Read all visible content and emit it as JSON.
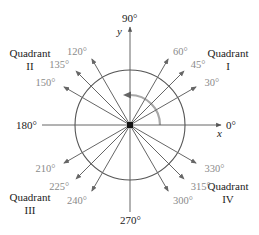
{
  "diagram": {
    "center": [
      130,
      125
    ],
    "circle_radius": 55,
    "axes": {
      "x_label": "x",
      "y_label": "y",
      "deg_0": "0°",
      "deg_90": "90°",
      "deg_180": "180°",
      "deg_270": "270°"
    },
    "quadrants": {
      "q1": {
        "line1": "Quadrant",
        "line2": "I"
      },
      "q2": {
        "line1": "Quadrant",
        "line2": "II"
      },
      "q3": {
        "line1": "Quadrant",
        "line2": "III"
      },
      "q4": {
        "line1": "Quadrant",
        "line2": "IV"
      }
    },
    "angles": [
      {
        "deg": 30,
        "label": "30°"
      },
      {
        "deg": 45,
        "label": "45°"
      },
      {
        "deg": 60,
        "label": "60°"
      },
      {
        "deg": 120,
        "label": "120°"
      },
      {
        "deg": 135,
        "label": "135°"
      },
      {
        "deg": 150,
        "label": "150°"
      },
      {
        "deg": 210,
        "label": "210°"
      },
      {
        "deg": 225,
        "label": "225°"
      },
      {
        "deg": 240,
        "label": "240°"
      },
      {
        "deg": 300,
        "label": "300°"
      },
      {
        "deg": 315,
        "label": "315°"
      },
      {
        "deg": 330,
        "label": "330°"
      }
    ],
    "colors": {
      "axis": "#555555",
      "ray": "#666666",
      "circle": "#555555",
      "arc": "#a8a8a8",
      "angle_label": "#8a8a8a",
      "text": "#222222"
    }
  }
}
